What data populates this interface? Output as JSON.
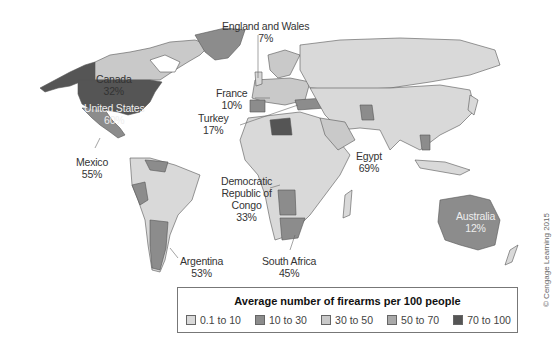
{
  "legend": {
    "title": "Average number of firearms per 100 people",
    "items": [
      {
        "label": "0.1 to 10",
        "color": "#d9d9d9"
      },
      {
        "label": "10 to 30",
        "color": "#8c8c8c"
      },
      {
        "label": "30 to 50",
        "color": "#c9c9c9"
      },
      {
        "label": "50 to 70",
        "color": "#a9a9a9"
      },
      {
        "label": "70 to 100",
        "color": "#555555"
      }
    ]
  },
  "labels": {
    "england": {
      "name": "England and Wales",
      "value": "7%"
    },
    "canada": {
      "name": "Canada",
      "value": "32%"
    },
    "us": {
      "name": "United States",
      "value": "60%"
    },
    "france": {
      "name": "France",
      "value": "10%"
    },
    "turkey": {
      "name": "Turkey",
      "value": "17%"
    },
    "mexico": {
      "name": "Mexico",
      "value": "55%"
    },
    "egypt": {
      "name": "Egypt",
      "value": "69%"
    },
    "drc": {
      "name1": "Democratic",
      "name2": "Republic of",
      "name3": "Congo",
      "value": "33%"
    },
    "australia": {
      "name": "Australia",
      "value": "12%"
    },
    "argentina": {
      "name": "Argentina",
      "value": "53%"
    },
    "south_africa": {
      "name": "South Africa",
      "value": "45%"
    }
  },
  "credit": "© Cengage Learning 2015"
}
